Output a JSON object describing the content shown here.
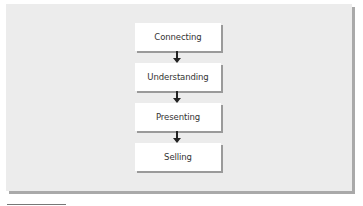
{
  "diagram": {
    "type": "vertical-flowchart",
    "steps": [
      {
        "label": "Connecting"
      },
      {
        "label": "Understanding"
      },
      {
        "label": "Presenting"
      },
      {
        "label": "Selling"
      }
    ],
    "connectors": [
      {
        "from": "Connecting",
        "to": "Understanding"
      },
      {
        "from": "Understanding",
        "to": "Presenting"
      },
      {
        "from": "Presenting",
        "to": "Selling"
      }
    ],
    "colors": {
      "panel_background": "#ececec",
      "panel_shadow": "#a9a9a9",
      "box_background": "#ffffff",
      "box_shadow": "#9a9a9a",
      "arrow": "#222222",
      "text": "#333333"
    }
  }
}
